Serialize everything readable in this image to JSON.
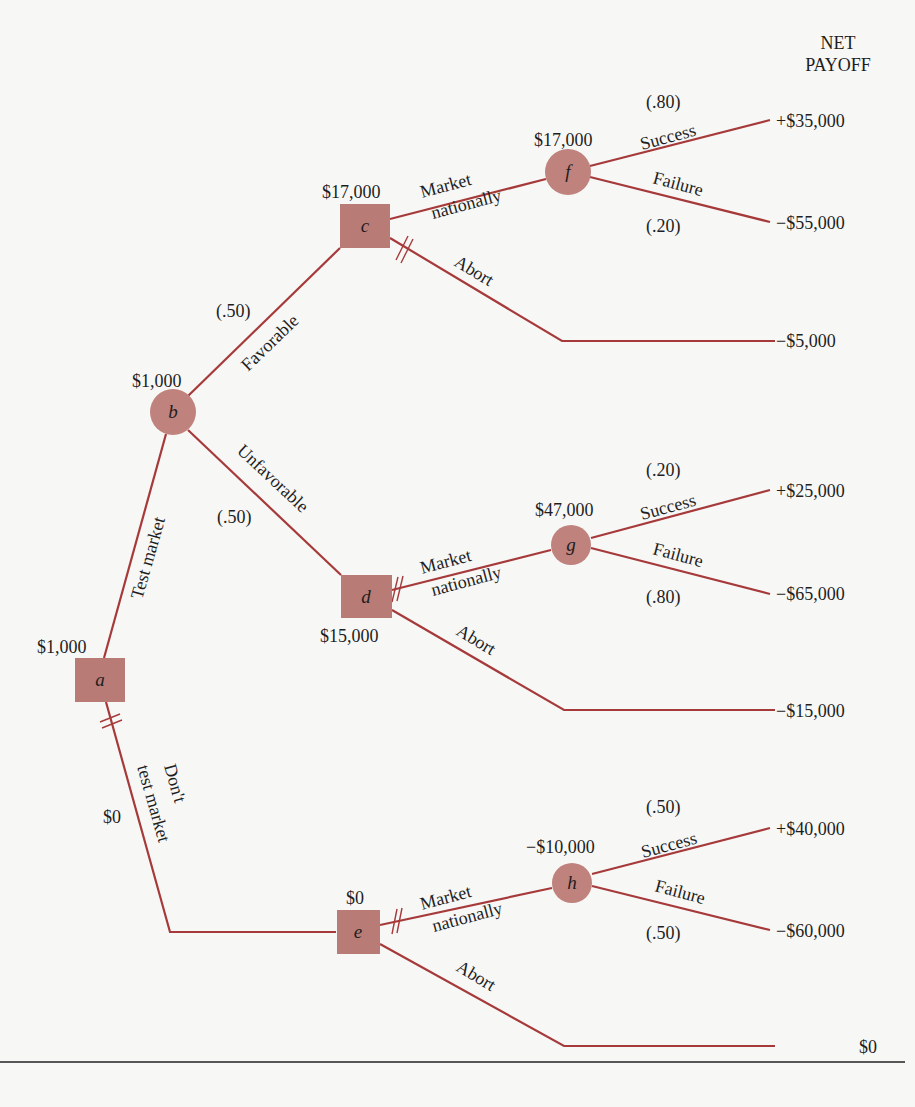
{
  "header": {
    "line1": "NET",
    "line2": "PAYOFF"
  },
  "colors": {
    "edge": "#a63a3a",
    "decision_node": "#b97b76",
    "chance_node": "#bf827d"
  },
  "nodes": {
    "a": {
      "label": "a",
      "type": "decision",
      "value": "$1,000"
    },
    "b": {
      "label": "b",
      "type": "chance",
      "value": "$1,000"
    },
    "c": {
      "label": "c",
      "type": "decision",
      "value": "$17,000"
    },
    "d": {
      "label": "d",
      "type": "decision",
      "value": "$15,000"
    },
    "e": {
      "label": "e",
      "type": "decision",
      "value": "$0"
    },
    "f": {
      "label": "f",
      "type": "chance",
      "value": "$17,000"
    },
    "g": {
      "label": "g",
      "type": "chance",
      "value": "$47,000"
    },
    "h": {
      "label": "h",
      "type": "chance",
      "value": "−$10,000"
    }
  },
  "edges": {
    "test_market": {
      "label": "Test market"
    },
    "dont_test": {
      "line1": "Don't",
      "line2": "test market",
      "value": "$0"
    },
    "favorable": {
      "label": "Favorable",
      "prob": "(.50)"
    },
    "unfavorable": {
      "label": "Unfavorable",
      "prob": "(.50)"
    },
    "c_market": {
      "line1": "Market",
      "line2": "nationally"
    },
    "c_abort": {
      "label": "Abort"
    },
    "d_market": {
      "line1": "Market",
      "line2": "nationally"
    },
    "d_abort": {
      "label": "Abort"
    },
    "e_market": {
      "line1": "Market",
      "line2": "nationally"
    },
    "e_abort": {
      "label": "Abort"
    },
    "f_success": {
      "label": "Success",
      "prob": "(.80)"
    },
    "f_failure": {
      "label": "Failure",
      "prob": "(.20)"
    },
    "g_success": {
      "label": "Success",
      "prob": "(.20)"
    },
    "g_failure": {
      "label": "Failure",
      "prob": "(.80)"
    },
    "h_success": {
      "label": "Success",
      "prob": "(.50)"
    },
    "h_failure": {
      "label": "Failure",
      "prob": "(.50)"
    }
  },
  "payoffs": {
    "f_success": "+$35,000",
    "f_failure": "−$55,000",
    "c_abort": "−$5,000",
    "g_success": "+$25,000",
    "g_failure": "−$65,000",
    "d_abort": "−$15,000",
    "h_success": "+$40,000",
    "h_failure": "−$60,000",
    "e_abort": "$0"
  }
}
